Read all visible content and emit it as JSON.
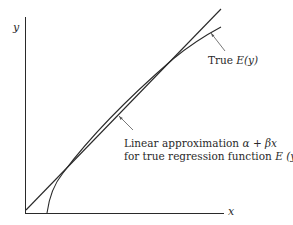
{
  "figure": {
    "axes": {
      "x_label": "x",
      "y_label": "y"
    },
    "annotations": {
      "true_curve_label_prefix": "True ",
      "true_curve_label_fn": "E(y)",
      "linear_label_line1_prefix": "Linear approximation ",
      "linear_label_line1_math": "α + βx",
      "linear_label_line2_prefix": "for true regression function ",
      "linear_label_line2_math": "E (y)"
    },
    "curves": [
      {
        "name": "Linear approximation",
        "equation": "α + βx",
        "type": "straight-line"
      },
      {
        "name": "True regression function",
        "equation": "E(y)",
        "type": "concave-curve"
      }
    ],
    "colors": {
      "ink": "#2a2a2a",
      "background": "#ffffff"
    }
  }
}
